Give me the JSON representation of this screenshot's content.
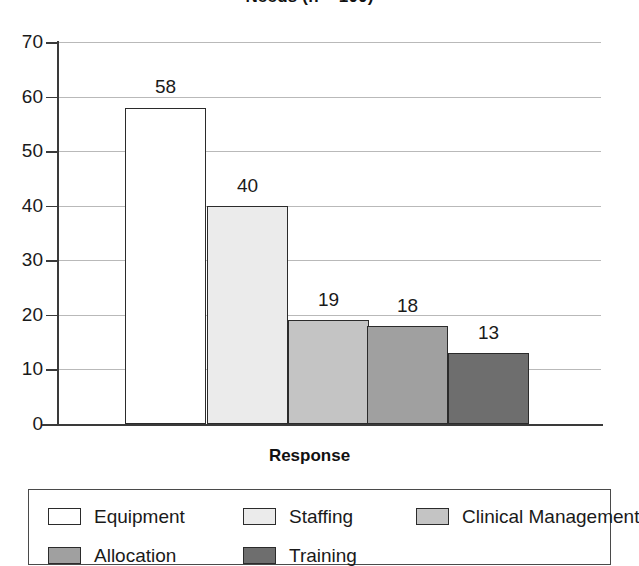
{
  "chart_data": {
    "type": "bar",
    "title": "Needs (n = 100)",
    "xlabel": "Response",
    "ylabel": "",
    "categories": [
      "Equipment",
      "Staffing",
      "Clinical Management",
      "Allocation",
      "Training"
    ],
    "values": [
      58,
      40,
      19,
      18,
      13
    ],
    "value_labels": [
      "58",
      "40",
      "19",
      "18",
      "13"
    ],
    "ylim": [
      0,
      70
    ],
    "yticks": [
      70,
      60,
      50,
      40,
      30,
      20,
      10,
      0
    ],
    "ytick_labels": [
      "70",
      "60",
      "50",
      "40",
      "30",
      "20",
      "10",
      "0"
    ],
    "grid": true,
    "legend_position": "bottom",
    "series_colors": [
      "#ffffff",
      "#ebebeb",
      "#c4c4c4",
      "#a0a0a0",
      "#6e6e6e"
    ],
    "bar_edge_color": "#2b2b2b",
    "gridline_color": "#b9b9b9",
    "axis_color": "#3a3a3a"
  },
  "legend": {
    "items": [
      {
        "label": "Equipment",
        "color": "#ffffff"
      },
      {
        "label": "Staffing",
        "color": "#ebebeb"
      },
      {
        "label": "Clinical Management",
        "color": "#c4c4c4"
      },
      {
        "label": "Allocation",
        "color": "#a0a0a0"
      },
      {
        "label": "Training",
        "color": "#6e6e6e"
      }
    ]
  }
}
